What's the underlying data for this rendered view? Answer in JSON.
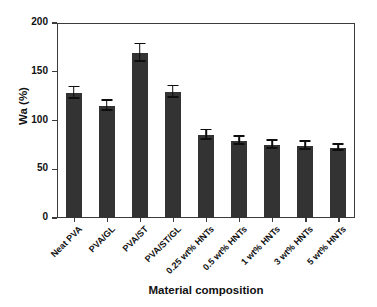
{
  "chart_data": {
    "type": "bar",
    "title": "",
    "xlabel": "Material composition",
    "ylabel": "Wa (%)",
    "ylim": [
      0,
      200
    ],
    "yticks": [
      0,
      50,
      100,
      150,
      200
    ],
    "grid": false,
    "legend": null,
    "bar_color": "#333333",
    "error_color": "#0d0d0d",
    "axis_color": "#3b3b3b",
    "categories": [
      "Neat PVA",
      "PVA/GL",
      "PVA/ST",
      "PVA/ST/GL",
      "0.25 wt% HNTs",
      "0.5 wt% HNTs",
      "1 wt% HNTs",
      "3 wt% HNTs",
      "5 wt% HNTs"
    ],
    "values": [
      128,
      115,
      169,
      129,
      85,
      79,
      75,
      74,
      72
    ],
    "errors": [
      6,
      5,
      9,
      6,
      5,
      4,
      4,
      4,
      3
    ]
  }
}
